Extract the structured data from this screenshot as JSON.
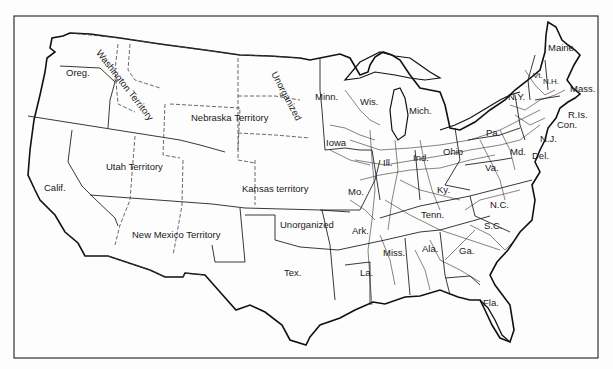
{
  "map": {
    "title": "United States railroads c. 1860 with states and territories",
    "frame_color": "#333333",
    "line_color": "#111111",
    "background": "#fdfdfd",
    "labels": {
      "oreg": "Oreg.",
      "washington": "Washington Territory",
      "unorganized_north": "Unorganized",
      "minn": "Minn.",
      "wis": "Wis.",
      "mich": "Mich.",
      "nebraska": "Nebraska Territory",
      "iowa": "Iowa",
      "utah": "Utah Territory",
      "calif": "Calif.",
      "kansas": "Kansas territory",
      "new_mexico": "New Mexico Territory",
      "unorganized_south": "Unorganized",
      "tex": "Tex.",
      "mo": "Mo.",
      "ark": "Ark.",
      "la": "La.",
      "miss": "Miss.",
      "ill": "Ill.",
      "ind": "Ind.",
      "ohio": "Ohio",
      "ky": "Ky.",
      "tenn": "Tenn.",
      "ala": "Ala.",
      "ga": "Ga.",
      "fla": "Fla.",
      "sc": "S.C.",
      "nc": "N.C.",
      "va": "Va.",
      "md": "Md.",
      "del": "Del.",
      "nj": "N.J.",
      "pa": "Pa.",
      "ny": "N.Y.",
      "vt": "Vt.",
      "nh": "N.H.",
      "maine": "Maine",
      "mass": "Mass.",
      "ri": "R.Is.",
      "con": "Con."
    }
  }
}
